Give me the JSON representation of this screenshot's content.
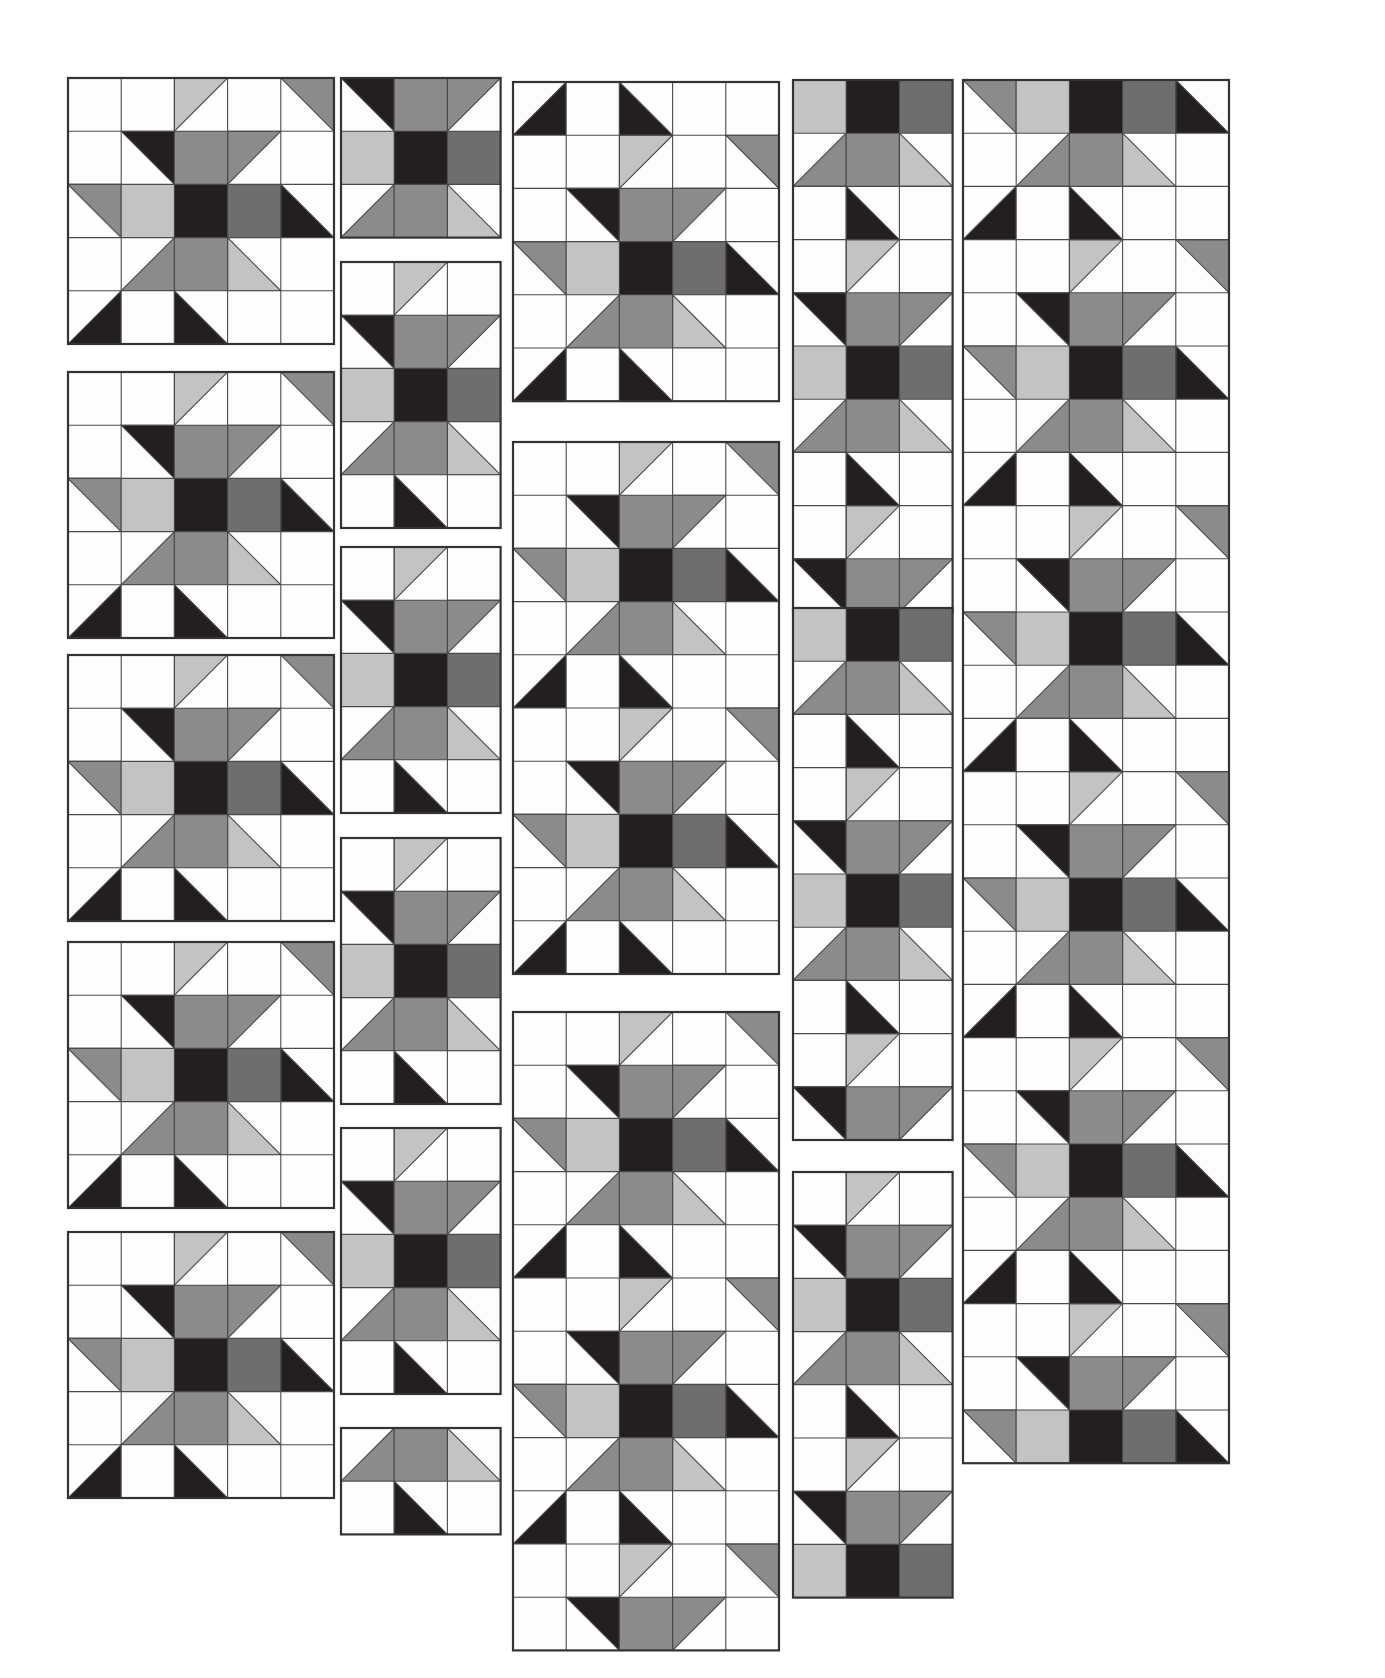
{
  "document": {
    "title": "Quilt Block Layout Sheet",
    "type": "patchwork-block-diagram",
    "background_color": "#ffffff",
    "cell_size_px": 53.2,
    "block_outline_color": "#333333",
    "cell_outline_color": "#4a4a4a"
  },
  "palette": {
    "white": "#fdfdfd",
    "light_gray": "#c3c3c3",
    "medium_gray": "#8b8b8b",
    "dark_gray": "#6e6e6e",
    "black": "#231f20"
  },
  "legend": {
    "tone_names": [
      "white",
      "light_gray",
      "medium_gray",
      "dark_gray",
      "black"
    ],
    "patch_types": [
      "square",
      "half-square-triangle"
    ]
  },
  "motif": {
    "name": "variable-star",
    "unit_grid": "5x5",
    "description": "Five-by-five pieced star block built from plain squares and half-square triangles.",
    "pattern": [
      [
        "W",
        "W",
        "HST:tl:LIGHT",
        "W",
        "HST:tr:MED"
      ],
      [
        "W",
        "HST:tr:BLACK",
        "SQ:MED",
        "HST:tl:MED",
        "W"
      ],
      [
        "HST:tr:MED",
        "SQ:LIGHT",
        "SQ:BLACK",
        "SQ:DARK",
        "HST:bl:BLACK"
      ],
      [
        "W",
        "HST:br:MED",
        "SQ:MED",
        "HST:bl:LIGHT",
        "W"
      ],
      [
        "HST:br:BLACK",
        "W",
        "HST:bl:BLACK",
        "W",
        "W"
      ]
    ]
  },
  "columns": [
    {
      "id": "column-1",
      "name": "column-1",
      "x": 68,
      "width_cells": 5,
      "blocks": [
        {
          "id": "c1-b1",
          "y": 78,
          "rows": 5,
          "cols": 5,
          "row_offset": 0,
          "col_offset": 0
        },
        {
          "id": "c1-b2",
          "y": 372,
          "rows": 5,
          "cols": 5,
          "row_offset": 0,
          "col_offset": 0
        },
        {
          "id": "c1-b3",
          "y": 655,
          "rows": 5,
          "cols": 5,
          "row_offset": 0,
          "col_offset": 0
        },
        {
          "id": "c1-b4",
          "y": 942,
          "rows": 5,
          "cols": 5,
          "row_offset": 0,
          "col_offset": 0
        },
        {
          "id": "c1-b5",
          "y": 1232,
          "rows": 5,
          "cols": 5,
          "row_offset": 0,
          "col_offset": 0
        }
      ]
    },
    {
      "id": "column-2",
      "name": "column-2",
      "x": 341,
      "width_cells": 3,
      "blocks": [
        {
          "id": "c2-b1",
          "y": 78,
          "rows": 3,
          "cols": 3,
          "row_offset": 1,
          "col_offset": 1
        },
        {
          "id": "c2-b2",
          "y": 262,
          "rows": 5,
          "cols": 3,
          "row_offset": 0,
          "col_offset": 1
        },
        {
          "id": "c2-b3",
          "y": 547,
          "rows": 5,
          "cols": 3,
          "row_offset": 0,
          "col_offset": 1
        },
        {
          "id": "c2-b4",
          "y": 838,
          "rows": 5,
          "cols": 3,
          "row_offset": 0,
          "col_offset": 1
        },
        {
          "id": "c2-b5",
          "y": 1128,
          "rows": 5,
          "cols": 3,
          "row_offset": 0,
          "col_offset": 1
        },
        {
          "id": "c2-b6",
          "y": 1428,
          "rows": 2,
          "cols": 3,
          "row_offset": 3,
          "col_offset": 1
        }
      ]
    },
    {
      "id": "column-3",
      "name": "column-3",
      "x": 513,
      "width_cells": 5,
      "blocks": [
        {
          "id": "c3-b1",
          "y": 82,
          "rows": 6,
          "cols": 5,
          "row_offset": 4,
          "col_offset": 0
        },
        {
          "id": "c3-b2",
          "y": 442,
          "rows": 10,
          "cols": 5,
          "row_offset": 0,
          "col_offset": 0
        },
        {
          "id": "c3-b3",
          "y": 1012,
          "rows": 12,
          "cols": 5,
          "row_offset": 0,
          "col_offset": 0
        }
      ]
    },
    {
      "id": "column-4",
      "name": "column-4",
      "x": 793,
      "width_cells": 3,
      "blocks": [
        {
          "id": "c4-b1",
          "y": 80,
          "rows": 10,
          "cols": 3,
          "row_offset": 2,
          "col_offset": 1
        },
        {
          "id": "c4-b2",
          "y": 608,
          "rows": 10,
          "cols": 3,
          "row_offset": 2,
          "col_offset": 1
        },
        {
          "id": "c4-b3",
          "y": 1172,
          "rows": 8,
          "cols": 3,
          "row_offset": 0,
          "col_offset": 1
        }
      ]
    },
    {
      "id": "column-5",
      "name": "column-5",
      "x": 963,
      "width_cells": 5,
      "blocks": [
        {
          "id": "c5-b1",
          "y": 80,
          "rows": 26,
          "cols": 5,
          "row_offset": 2,
          "col_offset": 0
        }
      ]
    }
  ],
  "summary": {
    "total_columns": 5,
    "total_blocks": 18,
    "grid_unit": "53.2 px square",
    "sheet_width_px": 1385,
    "sheet_height_px": 1678
  }
}
